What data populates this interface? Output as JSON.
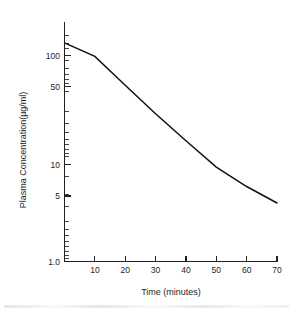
{
  "chart_data": {
    "type": "line",
    "title": "",
    "subtitle": "",
    "xlabel": "Time (minutes)",
    "ylabel": "Plasma Concentration(µg/ml)",
    "xscale": "linear",
    "yscale": "log",
    "xlim": [
      0,
      70
    ],
    "ylim": [
      1.0,
      150
    ],
    "grid": false,
    "legend": false,
    "legend_position": "none",
    "x_tick_labels": [
      "10",
      "20",
      "30",
      "40",
      "50",
      "60",
      "70"
    ],
    "x_tick_values": [
      10,
      20,
      30,
      40,
      50,
      60,
      70
    ],
    "y_tick_labels": [
      "100",
      "50",
      "10",
      "5",
      "1.0"
    ],
    "y_tick_values": [
      100,
      50,
      10,
      5,
      1.0
    ],
    "series": [
      {
        "name": "Plasma concentration",
        "color": "#111111",
        "x": [
          0,
          10,
          20,
          30,
          40,
          50,
          60,
          70
        ],
        "values": [
          97,
          73,
          40,
          22,
          12.5,
          7.2,
          4.8,
          3.4
        ]
      }
    ],
    "annotations": []
  },
  "axes": {
    "x_title": "Time (minutes)",
    "y_title": "Plasma Concentration(µg/ml)"
  }
}
